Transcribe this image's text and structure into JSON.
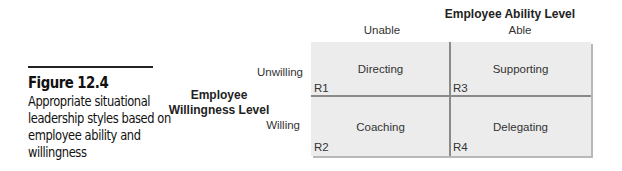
{
  "caption": {
    "figure_label": "Figure 12.4",
    "description": "Appropriate situational leadership styles based on employee ability and willingness"
  },
  "axes": {
    "x_title": "Employee Ability Level",
    "x_ticks": [
      "Unable",
      "Able"
    ],
    "y_title_line1": "Employee",
    "y_title_line2": "Willingness Level",
    "y_ticks": [
      "Unwilling",
      "Willing"
    ]
  },
  "quadrants": [
    {
      "code": "R1",
      "style": "Directing",
      "ability": "Unable",
      "willingness": "Unwilling"
    },
    {
      "code": "R3",
      "style": "Supporting",
      "ability": "Able",
      "willingness": "Unwilling"
    },
    {
      "code": "R2",
      "style": "Coaching",
      "ability": "Unable",
      "willingness": "Willing"
    },
    {
      "code": "R4",
      "style": "Delegating",
      "ability": "Able",
      "willingness": "Willing"
    }
  ],
  "colors": {
    "cell_fill": "#ececec",
    "divider": "#8a8a8a",
    "shadow": "#b8b8b8"
  }
}
